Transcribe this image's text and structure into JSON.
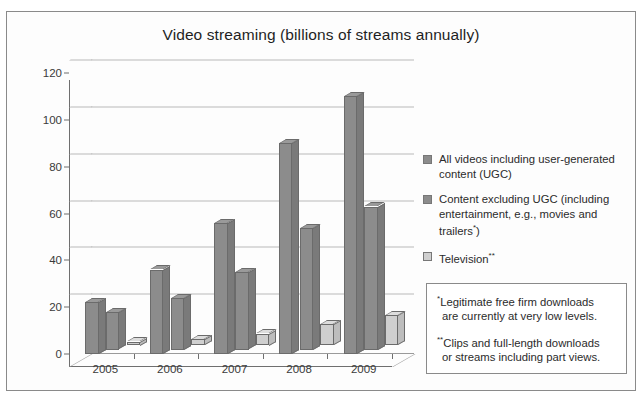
{
  "chart_data": {
    "type": "bar",
    "title": "Video streaming (billions of streams annually)",
    "xlabel": "",
    "ylabel": "",
    "categories": [
      "2005",
      "2006",
      "2007",
      "2008",
      "2009"
    ],
    "ylim": [
      0,
      120
    ],
    "yticks": [
      0,
      20,
      40,
      60,
      80,
      100,
      120
    ],
    "grid": true,
    "legend_position": "right",
    "style": "3d-clustered-column",
    "series": [
      {
        "name": "All videos including user-generated content (UGC)",
        "color": "#8c8c8c",
        "values": [
          22,
          36,
          56,
          90,
          110
        ]
      },
      {
        "name": "Content excluding UGC (including entertainment, e.g., movies and trailers*)",
        "color": "#8c8c8c",
        "values": [
          16,
          22,
          33,
          52,
          61
        ]
      },
      {
        "name": "Television**",
        "color": "#cfcfcf",
        "values": [
          1.5,
          2.5,
          5,
          9,
          13
        ]
      }
    ],
    "annotations": [
      "*Legitimate free firm downloads are currently at very low levels.",
      "**Clips and full-length downloads or streams including part views."
    ]
  },
  "legend": {
    "items": [
      {
        "label_main": "All videos including user-generated content (UGC)",
        "line1": "All videos including user-generated",
        "line2": "content (UGC)",
        "swatch_color": "#8c8c8c"
      },
      {
        "label_main": "Content excluding UGC (including entertainment, e.g., movies and trailers*)",
        "line1": "Content excluding UGC (including",
        "line2": "entertainment, e.g., movies and",
        "line3_pre": "trailers",
        "line3_sup": "*",
        "line3_post": ")",
        "swatch_color": "#8c8c8c"
      },
      {
        "label_main": "Television**",
        "line1": "Television",
        "line1_sup": "**",
        "swatch_color": "#cfcfcf"
      }
    ]
  },
  "notes": {
    "note1_marker": "*",
    "note1_line1": "Legitimate free firm downloads",
    "note1_line2": "are currently at very low levels.",
    "note2_marker": "**",
    "note2_line1": "Clips and full-length downloads",
    "note2_line2": "or streams including part views."
  },
  "axis": {
    "y_labels": [
      "120",
      "100",
      "80",
      "60",
      "40",
      "20",
      "0"
    ],
    "x_labels": [
      "2005",
      "2006",
      "2007",
      "2008",
      "2009"
    ]
  }
}
